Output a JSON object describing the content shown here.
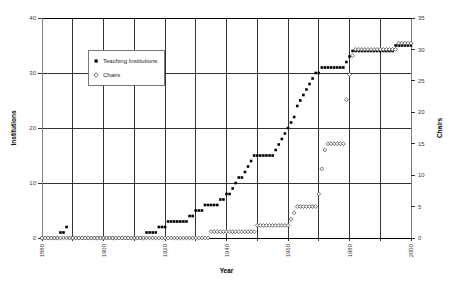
{
  "chart_data": {
    "type": "scatter",
    "title": "",
    "xlabel": "Year",
    "ylabel": "Institutions",
    "y2label": "Chairs",
    "xlim": [
      1880,
      2000
    ],
    "ylim": [
      0,
      40
    ],
    "y2lim": [
      0,
      35
    ],
    "xticks": [
      1880,
      1900,
      1920,
      1940,
      1960,
      1980,
      2000
    ],
    "xticklabels": [
      "1880",
      "1900",
      "1920",
      "1940",
      "1960",
      "1980",
      "2000"
    ],
    "xgrid_minor": [
      1890,
      1910,
      1930,
      1950,
      1970,
      1990
    ],
    "yticks": [
      0,
      10,
      20,
      30,
      40
    ],
    "yticklabels": [
      "0",
      "10",
      "20",
      "30",
      "40"
    ],
    "y2ticks": [
      0,
      5,
      10,
      15,
      20,
      25,
      30,
      35
    ],
    "y2ticklabels": [
      "0",
      "5",
      "10",
      "15",
      "20",
      "25",
      "30",
      "35"
    ],
    "grid": true,
    "legend_position": "upper-left-inset",
    "legend": [
      {
        "name": "Teaching Institutions",
        "marker": "filled-square",
        "color": "#000000"
      },
      {
        "name": "Chairs",
        "marker": "open-diamond",
        "color": "#ffffff"
      }
    ],
    "series": [
      {
        "name": "Teaching Institutions",
        "axis": "left",
        "marker": "filled-square",
        "color": "#000000",
        "x": [
          1880,
          1881,
          1882,
          1883,
          1884,
          1885,
          1886,
          1887,
          1888,
          1889,
          1890,
          1891,
          1892,
          1893,
          1894,
          1895,
          1896,
          1897,
          1898,
          1899,
          1900,
          1901,
          1902,
          1903,
          1904,
          1905,
          1906,
          1907,
          1908,
          1909,
          1910,
          1911,
          1912,
          1913,
          1914,
          1915,
          1916,
          1917,
          1918,
          1919,
          1920,
          1921,
          1922,
          1923,
          1924,
          1925,
          1926,
          1927,
          1928,
          1929,
          1930,
          1931,
          1932,
          1933,
          1934,
          1935,
          1936,
          1937,
          1938,
          1939,
          1940,
          1941,
          1942,
          1943,
          1944,
          1945,
          1946,
          1947,
          1948,
          1949,
          1950,
          1951,
          1952,
          1953,
          1954,
          1955,
          1956,
          1957,
          1958,
          1959,
          1960,
          1961,
          1962,
          1963,
          1964,
          1965,
          1966,
          1967,
          1968,
          1969,
          1970,
          1971,
          1972,
          1973,
          1974,
          1975,
          1976,
          1977,
          1978,
          1979,
          1980,
          1981,
          1982,
          1983,
          1984,
          1985,
          1986,
          1987,
          1988,
          1989,
          1990,
          1991,
          1992,
          1993,
          1994,
          1995,
          1996,
          1997,
          1998,
          1999,
          2000
        ],
        "y": [
          0,
          0,
          0,
          0,
          0,
          0,
          1,
          1,
          2,
          0,
          0,
          0,
          0,
          0,
          0,
          0,
          0,
          0,
          0,
          0,
          0,
          0,
          0,
          0,
          0,
          0,
          0,
          0,
          0,
          0,
          0,
          0,
          0,
          0,
          1,
          1,
          1,
          1,
          2,
          2,
          2,
          3,
          3,
          3,
          3,
          3,
          3,
          3,
          4,
          4,
          5,
          5,
          5,
          6,
          6,
          6,
          6,
          6,
          7,
          7,
          8,
          8,
          9,
          10,
          11,
          11,
          12,
          13,
          14,
          15,
          15,
          15,
          15,
          15,
          15,
          15,
          16,
          17,
          18,
          19,
          20,
          21,
          22,
          24,
          25,
          26,
          27,
          28,
          29,
          30,
          30,
          31,
          31,
          31,
          31,
          31,
          31,
          31,
          31,
          32,
          33,
          34,
          34,
          34,
          34,
          34,
          34,
          34,
          34,
          34,
          34,
          34,
          34,
          34,
          34,
          35,
          35,
          35,
          35,
          35,
          35
        ]
      },
      {
        "name": "Chairs",
        "axis": "right",
        "marker": "open-diamond",
        "color": "#ffffff",
        "x": [
          1880,
          1881,
          1882,
          1883,
          1884,
          1885,
          1886,
          1887,
          1888,
          1889,
          1890,
          1891,
          1892,
          1893,
          1894,
          1895,
          1896,
          1897,
          1898,
          1899,
          1900,
          1901,
          1902,
          1903,
          1904,
          1905,
          1906,
          1907,
          1908,
          1909,
          1910,
          1911,
          1912,
          1913,
          1914,
          1915,
          1916,
          1917,
          1918,
          1919,
          1920,
          1921,
          1922,
          1923,
          1924,
          1925,
          1926,
          1927,
          1928,
          1929,
          1930,
          1931,
          1932,
          1933,
          1934,
          1935,
          1936,
          1937,
          1938,
          1939,
          1940,
          1941,
          1942,
          1943,
          1944,
          1945,
          1946,
          1947,
          1948,
          1949,
          1950,
          1951,
          1952,
          1953,
          1954,
          1955,
          1956,
          1957,
          1958,
          1959,
          1960,
          1961,
          1962,
          1963,
          1964,
          1965,
          1966,
          1967,
          1968,
          1969,
          1970,
          1971,
          1972,
          1973,
          1974,
          1975,
          1976,
          1977,
          1978,
          1979,
          1980,
          1981,
          1982,
          1983,
          1984,
          1985,
          1986,
          1987,
          1988,
          1989,
          1990,
          1991,
          1992,
          1993,
          1994,
          1995,
          1996,
          1997,
          1998,
          1999,
          2000
        ],
        "y": [
          0,
          0,
          0,
          0,
          0,
          0,
          0,
          0,
          0,
          0,
          0,
          0,
          0,
          0,
          0,
          0,
          0,
          0,
          0,
          0,
          0,
          0,
          0,
          0,
          0,
          0,
          0,
          0,
          0,
          0,
          0,
          0,
          0,
          0,
          0,
          0,
          0,
          0,
          0,
          0,
          0,
          0,
          0,
          0,
          0,
          0,
          0,
          0,
          0,
          0,
          0,
          0,
          0,
          0,
          0,
          1,
          1,
          1,
          1,
          1,
          1,
          1,
          1,
          1,
          1,
          1,
          1,
          1,
          1,
          1,
          2,
          2,
          2,
          2,
          2,
          2,
          2,
          2,
          2,
          2,
          2,
          3,
          4,
          5,
          5,
          5,
          5,
          5,
          5,
          5,
          7,
          11,
          14,
          15,
          15,
          15,
          15,
          15,
          15,
          22,
          26,
          29,
          30,
          30,
          30,
          30,
          30,
          30,
          30,
          30,
          30,
          30,
          30,
          30,
          30,
          30,
          31,
          31,
          31,
          31,
          31
        ]
      }
    ]
  }
}
